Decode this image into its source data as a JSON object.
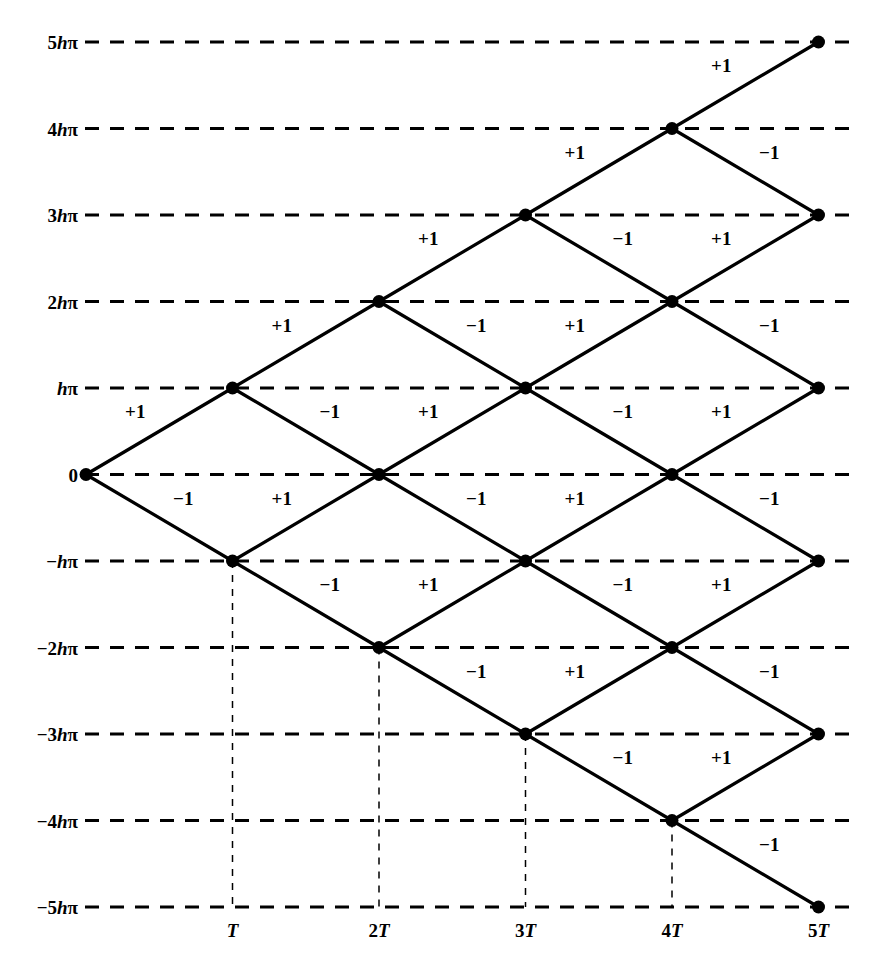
{
  "figure": {
    "type": "binomial-lattice-diagram",
    "background_color": "#ffffff",
    "ink_color": "#000000",
    "width": 870,
    "height": 970
  },
  "chart_data": {
    "type": "scatter",
    "title": "",
    "subtitle": "",
    "xlabel": "",
    "ylabel": "",
    "grid": true,
    "legend_position": "none",
    "xlim": [
      0,
      5
    ],
    "ylim": [
      -5,
      5
    ],
    "x_tick_values": [
      1,
      2,
      3,
      4,
      5
    ],
    "x_tick_labels": [
      "T",
      "2T",
      "3T",
      "4T",
      "5T"
    ],
    "y_tick_values": [
      5,
      4,
      3,
      2,
      1,
      0,
      -1,
      -2,
      -3,
      -4,
      -5
    ],
    "y_tick_labels": [
      "5hπ",
      "4hπ",
      "3hπ",
      "2hπ",
      "hπ",
      "0",
      "−hπ",
      "−2hπ",
      "−3hπ",
      "−4hπ",
      "−5hπ"
    ],
    "node_label": "lattice-node",
    "nodes": [
      {
        "step": 0,
        "level": 0
      },
      {
        "step": 1,
        "level": 1
      },
      {
        "step": 1,
        "level": -1
      },
      {
        "step": 2,
        "level": 2
      },
      {
        "step": 2,
        "level": 0
      },
      {
        "step": 2,
        "level": -2
      },
      {
        "step": 3,
        "level": 3
      },
      {
        "step": 3,
        "level": 1
      },
      {
        "step": 3,
        "level": -1
      },
      {
        "step": 3,
        "level": -3
      },
      {
        "step": 4,
        "level": 4
      },
      {
        "step": 4,
        "level": 2
      },
      {
        "step": 4,
        "level": 0
      },
      {
        "step": 4,
        "level": -2
      },
      {
        "step": 4,
        "level": -4
      },
      {
        "step": 5,
        "level": 5
      },
      {
        "step": 5,
        "level": 3
      },
      {
        "step": 5,
        "level": 1
      },
      {
        "step": 5,
        "level": -1
      },
      {
        "step": 5,
        "level": -3
      },
      {
        "step": 5,
        "level": -5
      }
    ],
    "edges": [
      {
        "from_step": 0,
        "from_level": 0,
        "to_level": 1,
        "label": "+1"
      },
      {
        "from_step": 0,
        "from_level": 0,
        "to_level": -1,
        "label": "−1"
      },
      {
        "from_step": 1,
        "from_level": 1,
        "to_level": 2,
        "label": "+1"
      },
      {
        "from_step": 1,
        "from_level": 1,
        "to_level": 0,
        "label": "−1"
      },
      {
        "from_step": 1,
        "from_level": -1,
        "to_level": 0,
        "label": "+1"
      },
      {
        "from_step": 1,
        "from_level": -1,
        "to_level": -2,
        "label": "−1"
      },
      {
        "from_step": 2,
        "from_level": 2,
        "to_level": 3,
        "label": "+1"
      },
      {
        "from_step": 2,
        "from_level": 2,
        "to_level": 1,
        "label": "−1"
      },
      {
        "from_step": 2,
        "from_level": 0,
        "to_level": 1,
        "label": "+1"
      },
      {
        "from_step": 2,
        "from_level": 0,
        "to_level": -1,
        "label": "−1"
      },
      {
        "from_step": 2,
        "from_level": -2,
        "to_level": -1,
        "label": "+1"
      },
      {
        "from_step": 2,
        "from_level": -2,
        "to_level": -3,
        "label": "−1"
      },
      {
        "from_step": 3,
        "from_level": 3,
        "to_level": 4,
        "label": "+1"
      },
      {
        "from_step": 3,
        "from_level": 3,
        "to_level": 2,
        "label": "−1"
      },
      {
        "from_step": 3,
        "from_level": 1,
        "to_level": 2,
        "label": "+1"
      },
      {
        "from_step": 3,
        "from_level": 1,
        "to_level": 0,
        "label": "−1"
      },
      {
        "from_step": 3,
        "from_level": -1,
        "to_level": 0,
        "label": "+1"
      },
      {
        "from_step": 3,
        "from_level": -1,
        "to_level": -2,
        "label": "−1"
      },
      {
        "from_step": 3,
        "from_level": -3,
        "to_level": -2,
        "label": "+1"
      },
      {
        "from_step": 3,
        "from_level": -3,
        "to_level": -4,
        "label": "−1"
      },
      {
        "from_step": 4,
        "from_level": 4,
        "to_level": 5,
        "label": "+1"
      },
      {
        "from_step": 4,
        "from_level": 4,
        "to_level": 3,
        "label": "−1"
      },
      {
        "from_step": 4,
        "from_level": 2,
        "to_level": 3,
        "label": "+1"
      },
      {
        "from_step": 4,
        "from_level": 2,
        "to_level": 1,
        "label": "−1"
      },
      {
        "from_step": 4,
        "from_level": 0,
        "to_level": 1,
        "label": "+1"
      },
      {
        "from_step": 4,
        "from_level": 0,
        "to_level": -1,
        "label": "−1"
      },
      {
        "from_step": 4,
        "from_level": -2,
        "to_level": -1,
        "label": "+1"
      },
      {
        "from_step": 4,
        "from_level": -2,
        "to_level": -3,
        "label": "−1"
      },
      {
        "from_step": 4,
        "from_level": -4,
        "to_level": -3,
        "label": "+1"
      },
      {
        "from_step": 4,
        "from_level": -4,
        "to_level": -5,
        "label": "−1"
      }
    ],
    "droplines": [
      {
        "step": 1,
        "from_level": -1
      },
      {
        "step": 2,
        "from_level": -2
      },
      {
        "step": 3,
        "from_level": -3
      },
      {
        "step": 4,
        "from_level": -4
      }
    ]
  },
  "y_axis": {
    "name": "y-axis",
    "ticks": [
      {
        "value": 5,
        "prefix": "5",
        "italic": "h",
        "suffix": "π"
      },
      {
        "value": 4,
        "prefix": "4",
        "italic": "h",
        "suffix": "π"
      },
      {
        "value": 3,
        "prefix": "3",
        "italic": "h",
        "suffix": "π"
      },
      {
        "value": 2,
        "prefix": "2",
        "italic": "h",
        "suffix": "π"
      },
      {
        "value": 1,
        "prefix": "",
        "italic": "h",
        "suffix": "π"
      },
      {
        "value": 0,
        "prefix": "0",
        "italic": "",
        "suffix": ""
      },
      {
        "value": -1,
        "prefix": "−",
        "italic": "h",
        "suffix": "π"
      },
      {
        "value": -2,
        "prefix": "−2",
        "italic": "h",
        "suffix": "π"
      },
      {
        "value": -3,
        "prefix": "−3",
        "italic": "h",
        "suffix": "π"
      },
      {
        "value": -4,
        "prefix": "−4",
        "italic": "h",
        "suffix": "π"
      },
      {
        "value": -5,
        "prefix": "−5",
        "italic": "h",
        "suffix": "π"
      }
    ]
  },
  "x_axis": {
    "name": "x-axis",
    "ticks": [
      {
        "value": 1,
        "prefix": "",
        "italic": "T"
      },
      {
        "value": 2,
        "prefix": "2",
        "italic": "T"
      },
      {
        "value": 3,
        "prefix": "3",
        "italic": "T"
      },
      {
        "value": 4,
        "prefix": "4",
        "italic": "T"
      },
      {
        "value": 5,
        "prefix": "5",
        "italic": "T"
      }
    ]
  },
  "style": {
    "gridline_color": "#000000",
    "gridline_dash": "14 11",
    "gridline_width": 3.2,
    "edge_width": 3.2,
    "dropline_width": 1.5,
    "dropline_dash": "7 7",
    "node_radius": 6.5
  }
}
